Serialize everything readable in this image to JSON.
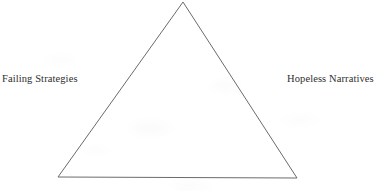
{
  "page": {
    "background_color": "#ffffff",
    "width": 384,
    "height": 191
  },
  "diagram": {
    "type": "triangle",
    "name": "triangle-diagram",
    "stroke_color": "#6b6b6b",
    "fill": "none",
    "stroke_width": 1,
    "vertices": {
      "apex": {
        "x": 183,
        "y": 2
      },
      "bottom_left": {
        "x": 58,
        "y": 177
      },
      "bottom_right": {
        "x": 297,
        "y": 178
      }
    }
  },
  "labels": {
    "left": {
      "text": "Failing Strategies",
      "color": "#2e2e2e"
    },
    "right": {
      "text": "Hopeless Narratives",
      "color": "#2e2e2e"
    }
  }
}
